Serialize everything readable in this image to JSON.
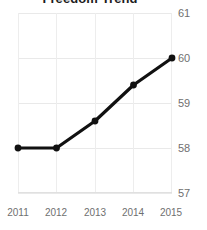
{
  "chart_data": {
    "type": "line",
    "title": "Freedom Trend",
    "xlabel": "",
    "ylabel": "",
    "categories": [
      "2011",
      "2012",
      "2013",
      "2014",
      "2015"
    ],
    "values": [
      58,
      58,
      58.6,
      59.4,
      60
    ],
    "series": [
      {
        "name": "Freedom Trend",
        "values": [
          58,
          58,
          58.6,
          59.4,
          60
        ]
      }
    ],
    "ylim": [
      57,
      61
    ],
    "yticks": [
      "57",
      "58",
      "59",
      "60",
      "61"
    ],
    "ytick_values": [
      57,
      58,
      59,
      60,
      61
    ],
    "xticks": [
      "2011",
      "2012",
      "2013",
      "2014",
      "2015"
    ],
    "grid": true,
    "legend": false,
    "legend_position": "none",
    "line_color": "#111111",
    "marker_color": "#111111",
    "grid_color": "#e9e9e9",
    "tick_label_color": "#6f6f6f",
    "background_color": "#ffffff",
    "y_axis_side": "right",
    "title_clipped": true
  }
}
